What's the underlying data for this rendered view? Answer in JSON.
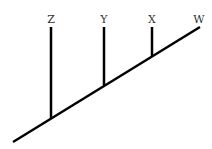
{
  "diagram": {
    "type": "cladogram",
    "taxa": [
      {
        "label": "Z",
        "x": 51,
        "top": 27,
        "branch_y": 117
      },
      {
        "label": "Y",
        "x": 104,
        "top": 27,
        "branch_y": 84
      },
      {
        "label": "X",
        "x": 152,
        "top": 27,
        "branch_y": 55
      },
      {
        "label": "W",
        "x": 200,
        "top": 27,
        "branch_y": 27
      }
    ],
    "trunk": {
      "x1": 13,
      "y1": 142,
      "x2": 200,
      "y2": 27
    },
    "line_color": "#000000"
  }
}
